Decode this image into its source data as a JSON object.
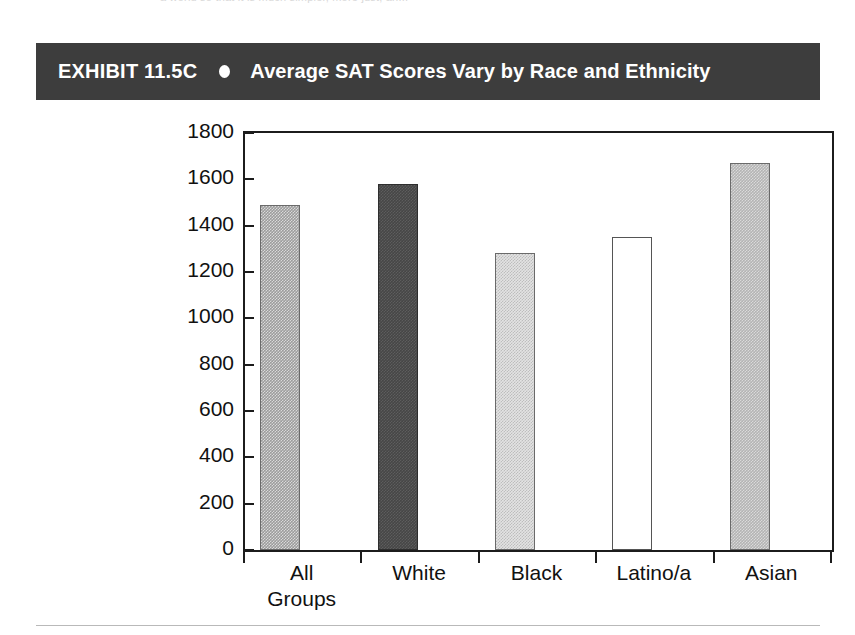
{
  "page": {
    "top_bleed_text": "a world so that it is much simpler, more just, an...",
    "background_color": "#ffffff"
  },
  "header": {
    "exhibit_label": "EXHIBIT 11.5C",
    "bullet_icon": "filled-circle-icon",
    "title": "Average SAT Scores Vary by Race and Ethnicity",
    "background_color": "#3d3d3d",
    "text_color": "#ffffff"
  },
  "chart_data": {
    "type": "bar",
    "title": "Average SAT Scores Vary by Race and Ethnicity",
    "xlabel": "",
    "ylabel": "",
    "ylim": [
      0,
      1800
    ],
    "yticks": [
      0,
      200,
      400,
      600,
      800,
      1000,
      1200,
      1400,
      1600,
      1800
    ],
    "ytick_labels": [
      "0",
      "200",
      "400",
      "600",
      "800",
      "1000",
      "1200",
      "1400",
      "1600",
      "1800"
    ],
    "grid": false,
    "legend": "none",
    "categories": [
      "All Groups",
      "White",
      "Black",
      "Latino/a",
      "Asian"
    ],
    "category_lines": [
      [
        "All",
        "Groups"
      ],
      [
        "White"
      ],
      [
        "Black"
      ],
      [
        "Latino/a"
      ],
      [
        "Asian"
      ]
    ],
    "values": [
      1490,
      1580,
      1280,
      1350,
      1670
    ],
    "bar_fills": [
      "fill-medgray",
      "fill-darkgray",
      "fill-lightgray",
      "fill-white",
      "fill-midlight"
    ],
    "bar_colors": [
      "#9c9c9c",
      "#464646",
      "#e3e3e3",
      "#ffffff",
      "#b4b4b4"
    ],
    "axis_color": "#1c1c1c"
  }
}
